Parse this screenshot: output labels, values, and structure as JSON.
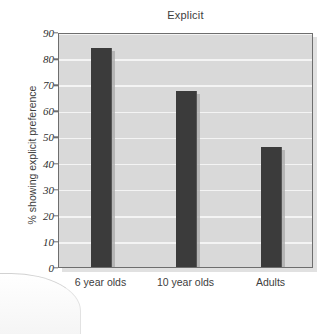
{
  "chart_data": {
    "type": "bar",
    "title": "Explicit",
    "xlabel": "",
    "ylabel": "% showing explicit preference",
    "categories": [
      "6 year olds",
      "10 year olds",
      "Adults"
    ],
    "values": [
      84,
      67.5,
      46
    ],
    "ylim": [
      0,
      90
    ],
    "ytick_labels": [
      "0",
      "10",
      "20",
      "30",
      "40",
      "50",
      "60",
      "70",
      "80",
      "90"
    ],
    "ytick_values": [
      0,
      10,
      20,
      30,
      40,
      50,
      60,
      70,
      80,
      90
    ],
    "grid": true,
    "legend": false,
    "colors": {
      "bar": "#3b3b3b",
      "plot_background": "#d9d9d9",
      "gridline": "#f4f4f4",
      "axis": "#6e6e6e",
      "text": "#3d3d3d",
      "figure_background": "#ffffff"
    }
  }
}
